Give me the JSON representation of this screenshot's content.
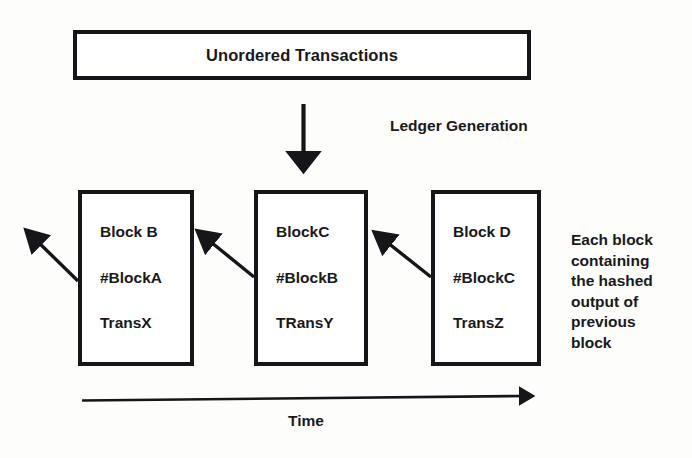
{
  "diagram": {
    "title": "Unordered Transactions",
    "process_label": "Ledger Generation",
    "timeline_label": "Time",
    "side_note_lines": [
      "Each block",
      "containing",
      "the hashed",
      "output of",
      "previous",
      "block"
    ],
    "blocks": [
      {
        "name": "Block B",
        "prev_hash": "#BlockA",
        "transaction": "TransX"
      },
      {
        "name": "BlockC",
        "prev_hash": "#BlockB",
        "transaction": "TRansY"
      },
      {
        "name": "Block D",
        "prev_hash": "#BlockC",
        "transaction": "TransZ"
      }
    ],
    "arrows": {
      "generation_arrow": "down-arrow-icon",
      "chain_arrow_1": "up-left-arrow-icon",
      "chain_arrow_2": "up-left-arrow-icon",
      "chain_arrow_3": "up-left-arrow-icon",
      "timeline_arrow": "right-arrow-icon"
    },
    "colors": {
      "ink": "#16161a",
      "paper": "#fdfdfc"
    }
  }
}
